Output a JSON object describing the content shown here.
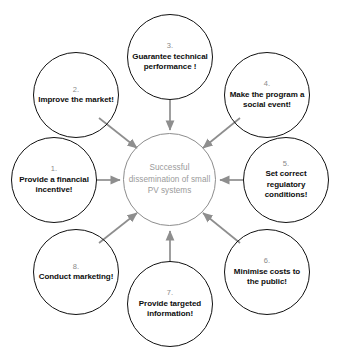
{
  "diagram": {
    "type": "hub-and-spoke",
    "center": {
      "label": "Successful dissemination of small PV systems",
      "border_color": "#8d8d8d",
      "text_color": "#9a9a9a"
    },
    "arrow_color": "#8e8e8e",
    "node_border_color": "#111111",
    "node_number_color": "#8a8a8a",
    "node_label_color": "#0d0d0d",
    "nodes": [
      {
        "number": "1.",
        "label": "Provide a financial incentive!",
        "position": "left"
      },
      {
        "number": "2.",
        "label": "Improve the market!",
        "position": "upper-left"
      },
      {
        "number": "3.",
        "label": "Guarantee technical performance !",
        "position": "top"
      },
      {
        "number": "4.",
        "label": "Make the program a social event!",
        "position": "upper-right"
      },
      {
        "number": "5.",
        "label": "Set correct regulatory conditions!",
        "position": "right"
      },
      {
        "number": "6.",
        "label": "Minimise costs to the public!",
        "position": "lower-right"
      },
      {
        "number": "7.",
        "label": "Provide targeted information!",
        "position": "bottom"
      },
      {
        "number": "8.",
        "label": "Conduct marketing!",
        "position": "lower-left"
      }
    ]
  }
}
